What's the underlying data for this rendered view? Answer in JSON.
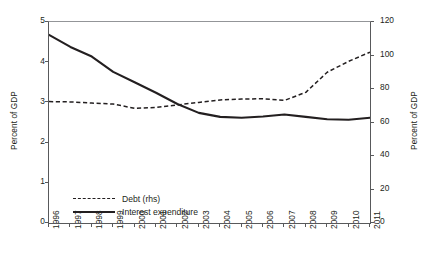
{
  "chart_data": {
    "type": "line",
    "title": "",
    "xlabel": "",
    "ylabel": "Percent of GDP",
    "y2label": "Percent of GDP",
    "grid": false,
    "legend_position": "bottom-left",
    "x": [
      1996,
      1997,
      1998,
      1999,
      2000,
      2001,
      2002,
      2003,
      2004,
      2005,
      2006,
      2007,
      2008,
      2009,
      2010,
      2011
    ],
    "categories": [
      "1996",
      "1997",
      "1998",
      "1999",
      "2000",
      "2001",
      "2002",
      "2003",
      "2004",
      "2005",
      "2006",
      "2007",
      "2008",
      "2009",
      "2010",
      "2011"
    ],
    "ylim": [
      0,
      5
    ],
    "yticks": [
      0,
      1,
      2,
      3,
      4,
      5
    ],
    "ytick_labels": [
      "0",
      "1",
      "2",
      "3",
      "4",
      "5"
    ],
    "y2lim": [
      0,
      120
    ],
    "y2ticks": [
      0,
      20,
      40,
      60,
      80,
      100,
      120
    ],
    "y2tick_labels": [
      "0",
      "20",
      "40",
      "60",
      "80",
      "100",
      "120"
    ],
    "series": [
      {
        "name": "Debt (rhs)",
        "axis": "right",
        "style": "dashed",
        "color": "#231f20",
        "values": [
          72.5,
          72.3,
          71.6,
          71.0,
          68.5,
          69.0,
          70.5,
          72.0,
          73.5,
          74.0,
          74.2,
          73.2,
          78.0,
          90.0,
          96.5,
          102.0
        ]
      },
      {
        "name": "Interest expenditure",
        "axis": "left",
        "style": "solid",
        "color": "#231f20",
        "values": [
          4.68,
          4.38,
          4.14,
          3.76,
          3.5,
          3.24,
          2.96,
          2.74,
          2.64,
          2.62,
          2.65,
          2.7,
          2.64,
          2.58,
          2.57,
          2.62
        ]
      }
    ]
  },
  "axes": {
    "left": {
      "title": "Percent of GDP"
    },
    "right": {
      "title": "Percent of GDP"
    }
  },
  "legend": {
    "items": [
      {
        "label": "Debt (rhs)",
        "style": "dashed"
      },
      {
        "label": "Interest expenditure",
        "style": "solid"
      }
    ]
  }
}
